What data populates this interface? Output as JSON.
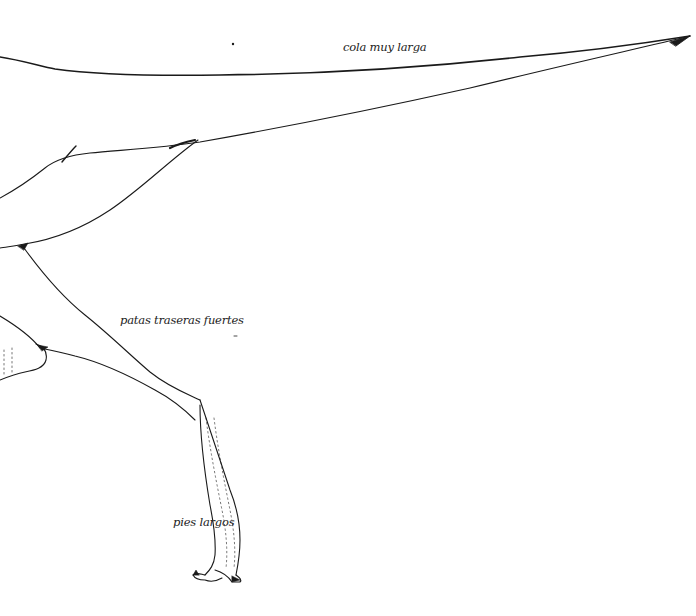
{
  "illustration": {
    "subject": "dinosaur hindquarters line drawing",
    "stroke_color": "#1a1a1a",
    "background": "#ffffff",
    "labels": [
      {
        "id": "tail",
        "text": "cola muy larga",
        "x": 343,
        "y": 40
      },
      {
        "id": "legs",
        "text": "patas traseras fuertes",
        "x": 120,
        "y": 313
      },
      {
        "id": "feet",
        "text": "pies largos",
        "x": 173,
        "y": 515
      }
    ]
  }
}
